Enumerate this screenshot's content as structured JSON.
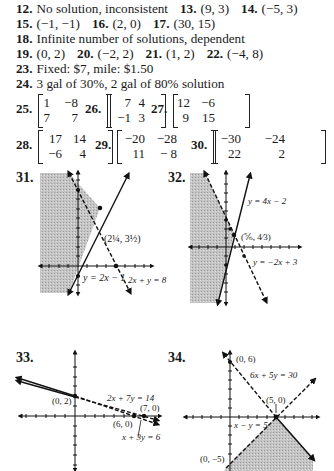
{
  "answers": [
    {
      "items": [
        {
          "n": "12.",
          "t": "No solution, inconsistent"
        },
        {
          "n": "13.",
          "t": "(9, 3)"
        },
        {
          "n": "14.",
          "t": "(−5, 3)"
        }
      ]
    },
    {
      "items": [
        {
          "n": "15.",
          "t": "(−1, −1)"
        },
        {
          "n": "16.",
          "t": "(2, 0)"
        },
        {
          "n": "17.",
          "t": "(30, 15)"
        }
      ]
    },
    {
      "items": [
        {
          "n": "18.",
          "t": "Infinite number of solutions, dependent"
        }
      ]
    },
    {
      "items": [
        {
          "n": "19.",
          "t": "(0, 2)"
        },
        {
          "n": "20.",
          "t": "(−2, 2)"
        },
        {
          "n": "21.",
          "t": "(1, 2)"
        },
        {
          "n": "22.",
          "t": "(−4, 8)"
        }
      ]
    },
    {
      "items": [
        {
          "n": "23.",
          "t": "Fixed: $7, mile: $1.50"
        }
      ]
    },
    {
      "items": [
        {
          "n": "24.",
          "t": "3 gal of 30%, 2 gal of 80% solution"
        }
      ]
    }
  ],
  "matrices": [
    {
      "n": "25.",
      "rows": [
        [
          "1",
          "−8"
        ],
        [
          "7",
          "7"
        ]
      ]
    },
    {
      "n": "26.",
      "rows": [
        [
          "7",
          "4"
        ],
        [
          "−1",
          "3"
        ]
      ]
    },
    {
      "n": "27.",
      "rows": [
        [
          "12",
          "−6"
        ],
        [
          "9",
          "15"
        ]
      ]
    },
    {
      "n": "28.",
      "rows": [
        [
          "17",
          "14"
        ],
        [
          "−6",
          "4"
        ]
      ]
    },
    {
      "n": "29.",
      "rows": [
        [
          "−20",
          "−28"
        ],
        [
          "11",
          "− 8"
        ]
      ]
    },
    {
      "n": "30.",
      "rows": [
        [
          "−30",
          "−24"
        ],
        [
          "22",
          "2"
        ]
      ]
    }
  ],
  "graphs": [
    {
      "n": "31.",
      "labels": {
        "point": "(2¼, 3½)",
        "line1": "y = 2x − 1",
        "line2": "2x + y = 8"
      }
    },
    {
      "n": "32.",
      "labels": {
        "point": "(⅚, 4⁄3)",
        "line1": "y = 4x − 2",
        "line2": "y = −2x + 3"
      }
    },
    {
      "n": "33.",
      "labels": {
        "p1": "(0, 2)",
        "p2": "(6, 0)",
        "p3": "(7, 0)",
        "line1": "2x + 7y = 14",
        "line2": "x + 3y = 6"
      }
    },
    {
      "n": "34.",
      "labels": {
        "p1": "(0, 6)",
        "p2": "(5, 0)",
        "p3": "(0, −5)",
        "line1": "6x + 5y = 30",
        "line2": "x − y = 5"
      }
    }
  ],
  "chart_data": [
    {
      "type": "line",
      "title": "31",
      "series": [
        {
          "name": "y = 2x − 1",
          "style": "solid"
        },
        {
          "name": "2x + y = 8",
          "style": "dashed"
        }
      ],
      "intersection": [
        2.25,
        3.5
      ],
      "shaded": "left of both lines"
    },
    {
      "type": "line",
      "title": "32",
      "series": [
        {
          "name": "y = 4x − 2",
          "style": "solid"
        },
        {
          "name": "y = −2x + 3",
          "style": "dashed"
        }
      ],
      "intersection": [
        0.8333,
        1.3333
      ],
      "shaded": "left of both lines"
    },
    {
      "type": "line",
      "title": "33",
      "series": [
        {
          "name": "2x + 7y = 14",
          "style": "solid/dashed",
          "points": [
            [
              0,
              2
            ],
            [
              7,
              0
            ]
          ]
        },
        {
          "name": "x + 3y = 6",
          "style": "solid/dashed",
          "points": [
            [
              0,
              2
            ],
            [
              6,
              0
            ]
          ]
        }
      ]
    },
    {
      "type": "line",
      "title": "34",
      "series": [
        {
          "name": "6x + 5y = 30",
          "style": "dashed",
          "points": [
            [
              0,
              6
            ],
            [
              5,
              0
            ]
          ]
        },
        {
          "name": "x − y = 5",
          "style": "dashed",
          "points": [
            [
              0,
              -5
            ],
            [
              5,
              0
            ]
          ]
        }
      ],
      "shaded": "below both lines"
    }
  ]
}
